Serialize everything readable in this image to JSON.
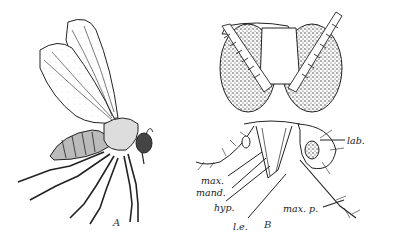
{
  "figure": {
    "panels": [
      {
        "id": "A",
        "label": "A",
        "subject": "winged-insect-side-view"
      },
      {
        "id": "B",
        "label": "B",
        "subject": "insect-head-front-view"
      }
    ],
    "labels": {
      "lab": "lab.",
      "max": "max.",
      "mand": "mand.",
      "hyp": "hyp.",
      "le": "l.e.",
      "maxp": "max. p."
    }
  }
}
